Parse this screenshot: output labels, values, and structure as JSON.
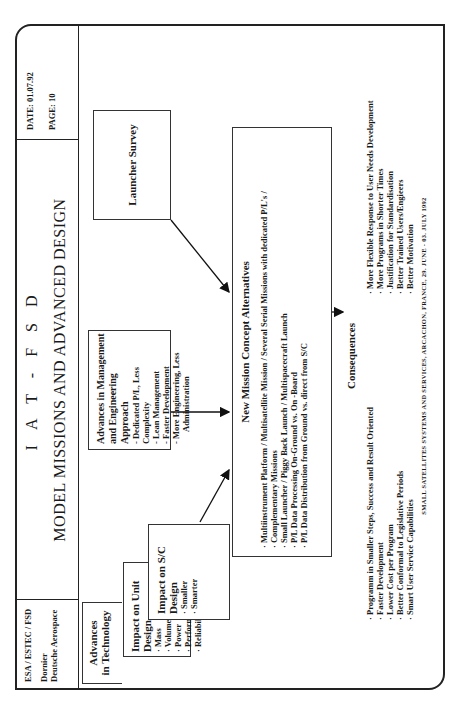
{
  "header": {
    "org_line1": "ESA / ESTEC / FSD",
    "org_line2": "Dornier",
    "org_line3": "Deutsche Aerospace",
    "title": "I A T  -  F S D",
    "subtitle": "MODEL MISSIONS AND ADVANCED DESIGN",
    "date": "DATE:  01.07.92",
    "page": "PAGE: 10"
  },
  "boxes": {
    "technology": {
      "title_line1": "Advances",
      "title_line2": "in Technology"
    },
    "unit_design": {
      "title": "Impact on Unit Design",
      "items": [
        "Mass",
        "Volume",
        "Power",
        "Performance",
        "Reliability"
      ]
    },
    "sc_design": {
      "title": "Impact on S/C Design",
      "items": [
        "Smaller",
        "Smarter"
      ]
    },
    "management": {
      "title_line1": "Advances in Management",
      "title_line2": "and Engineering Approach",
      "items": [
        "Dedicated P/L, Less Complexity",
        "Lean Management",
        "Faster Development",
        "More Engineering, Less"
      ],
      "continuation": "Administration"
    },
    "launcher": {
      "title": "Launcher Survey"
    },
    "mission_concept": {
      "title": "New Mission Concept Alternatives",
      "items": [
        "Multiinstrument Platform / Multisatellite Mission / Several Serial Missions with dedicated P/L's /",
        "Complementary Missions",
        "Small Launcher / Piggy Back Launch / Multispacecraft Launch",
        "P/L Data Processing On-Ground vs. On -Board",
        "P/L Data Distribution from Ground vs. direct from S/C"
      ]
    }
  },
  "consequences": {
    "title": "Consequences",
    "left": [
      "Programm in Smaller Steps, Success and Result Oriented",
      "Faster Development",
      "Lower Cost per Program",
      "Better Conformal to Legislative Periods",
      "Smart User Service Capabilities"
    ],
    "right": [
      "More Flexible Response to User Needs Development",
      "More Programs in Shorter Times",
      "Justification for Standardisation",
      "Better Trained Users/Engieers",
      "Better Motivation"
    ]
  },
  "footer": "SMALL SATELLITES SYSTEMS AND SERVICES, ARCACHON, FRANCE, 29. JUNE - 03. JULY 1992"
}
